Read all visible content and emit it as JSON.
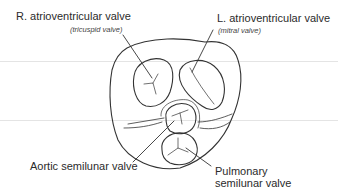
{
  "diagram": {
    "type": "anatomical-illustration",
    "labels": {
      "right_av": {
        "title": "R. atrioventricular valve",
        "subtitle": "(tricuspid valve)"
      },
      "left_av": {
        "title": "L. atrioventricular valve",
        "subtitle": "(mitral valve)"
      },
      "aortic": {
        "title": "Aortic semilunar valve"
      },
      "pulmonary": {
        "line1": "Pulmonary",
        "line2": "semilunar valve"
      }
    },
    "colors": {
      "stroke": "#333333",
      "guide_line": "#e4e4e4",
      "text": "#2b2b2b",
      "background": "#ffffff"
    }
  }
}
